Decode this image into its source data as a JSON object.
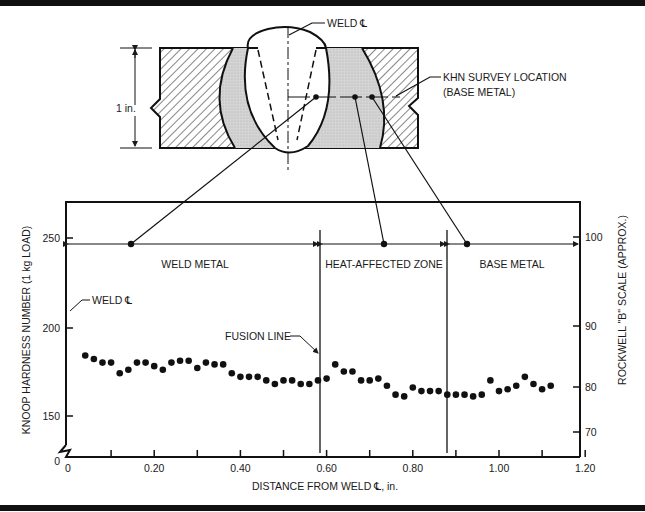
{
  "diagram": {
    "weld_centerline_label": "WELD ℄",
    "thickness_label": "1 in.",
    "survey_label_line1": "KHN SURVEY LOCATION",
    "survey_label_line2": "(BASE METAL)"
  },
  "chart_data": {
    "type": "scatter",
    "title": "",
    "xlabel": "DISTANCE FROM WELD ℄, in.",
    "ylabel": "KNOOP HARDNESS NUMBER (1 kg LOAD)",
    "y2label": "ROCKWELL \"B\" SCALE (APPROX.)",
    "xlim": [
      0,
      1.2
    ],
    "ylim_break": [
      0,
      140
    ],
    "ylim": [
      140,
      265
    ],
    "x_ticks": [
      0,
      0.1,
      0.2,
      0.3,
      0.4,
      0.5,
      0.6,
      0.7,
      0.8,
      0.9,
      1.0,
      1.1,
      1.2
    ],
    "x_tick_labels": [
      "0",
      "0.20",
      "0.40",
      "0.60",
      "0.80",
      "1.00",
      "1.20"
    ],
    "y_tick_labels": [
      "0",
      "150",
      "200",
      "250"
    ],
    "y2_tick_labels": [
      "70",
      "80",
      "90",
      "100"
    ],
    "grid": false,
    "zones": [
      {
        "name": "WELD METAL",
        "from": 0,
        "to": 0.59
      },
      {
        "name": "HEAT-AFFECTED ZONE",
        "from": 0.59,
        "to": 0.89
      },
      {
        "name": "BASE METAL",
        "from": 0.89,
        "to": 1.2
      }
    ],
    "annotations": [
      "WELD ℄",
      "FUSION LINE"
    ],
    "fusion_line_x": 0.59,
    "haz_boundary_x": 0.89,
    "series": [
      {
        "name": "KHN",
        "x": [
          0.04,
          0.06,
          0.08,
          0.1,
          0.12,
          0.14,
          0.16,
          0.18,
          0.2,
          0.22,
          0.24,
          0.26,
          0.28,
          0.3,
          0.32,
          0.34,
          0.36,
          0.38,
          0.4,
          0.42,
          0.44,
          0.46,
          0.48,
          0.5,
          0.52,
          0.54,
          0.56,
          0.58,
          0.6,
          0.62,
          0.64,
          0.66,
          0.68,
          0.7,
          0.72,
          0.74,
          0.76,
          0.78,
          0.8,
          0.82,
          0.84,
          0.86,
          0.88,
          0.9,
          0.92,
          0.94,
          0.96,
          0.98,
          1.0,
          1.02,
          1.04,
          1.06,
          1.08,
          1.1,
          1.12
        ],
        "y": [
          184,
          182,
          180,
          180,
          174,
          176,
          180,
          180,
          178,
          176,
          180,
          181,
          181,
          177,
          180,
          179,
          179,
          174,
          172,
          172,
          172,
          170,
          168,
          170,
          170,
          168,
          168,
          170,
          171,
          179,
          175,
          175,
          170,
          170,
          171,
          167,
          162,
          161,
          166,
          164,
          164,
          164,
          162,
          162,
          162,
          161,
          162,
          170,
          164,
          165,
          167,
          172,
          168,
          165,
          167
        ]
      }
    ]
  }
}
